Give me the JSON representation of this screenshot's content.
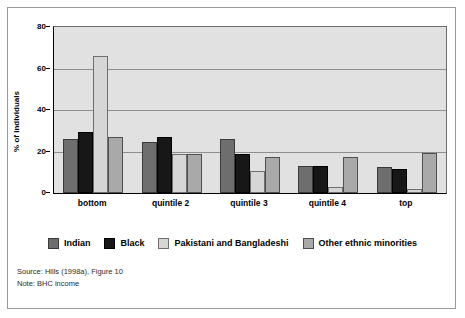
{
  "figure": {
    "frame_border_color": "#9a9a9a",
    "page_background": "#ffffff"
  },
  "chart_data": {
    "type": "bar",
    "title": "",
    "subtitle": "",
    "xlabel": "",
    "ylabel": "% of individuals",
    "ylim": [
      0,
      80
    ],
    "yticks": [
      0,
      20,
      40,
      60,
      80
    ],
    "ytick_labels": [
      "0",
      "20",
      "40",
      "60",
      "80"
    ],
    "grid": true,
    "grid_axis": "y",
    "legend_position": "bottom",
    "plot_background": "#e1e1e1",
    "categories": [
      "bottom",
      "quintile 2",
      "quintile 3",
      "quintile 4",
      "top"
    ],
    "series": [
      {
        "name": "Indian",
        "color": "#6e6e6e",
        "values": [
          26,
          24.5,
          26,
          13,
          12.5
        ]
      },
      {
        "name": "Black",
        "color": "#171717",
        "values": [
          29.5,
          27,
          19,
          13,
          11.5
        ]
      },
      {
        "name": "Pakistani and Bangladeshi",
        "color": "#d6d6d6",
        "values": [
          66,
          19,
          10.5,
          3,
          2
        ]
      },
      {
        "name": "Other ethnic minorities",
        "color": "#a9a9a9",
        "values": [
          27,
          19,
          17.5,
          17.5,
          19.5
        ]
      }
    ]
  },
  "legend": {
    "items": [
      {
        "label": "Indian"
      },
      {
        "label": "Black"
      },
      {
        "label": "Pakistani and Bangladeshi"
      },
      {
        "label": "Other ethnic minorities"
      }
    ]
  },
  "footnotes": {
    "source": "Source: Hills (1998a), Figure 10",
    "note": "Note: BHC income"
  }
}
